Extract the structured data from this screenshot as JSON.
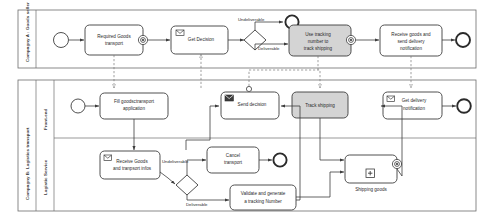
{
  "diagram": {
    "pools": [
      {
        "id": "poolA",
        "label": "Compagny A : Goods seller",
        "lanes": []
      },
      {
        "id": "poolB",
        "label": "Compagny B: Logistics transport",
        "lanes": [
          {
            "id": "laneFront",
            "label": "Front-end"
          },
          {
            "id": "laneService",
            "label": "Logistic Service"
          }
        ]
      }
    ],
    "nodes": {
      "a_start": {
        "type": "start-event",
        "label": ""
      },
      "a_required": {
        "type": "task",
        "label": "Required Goods transport",
        "marker": "message-send"
      },
      "a_decision": {
        "type": "task-message",
        "label": "Get Decision"
      },
      "a_gateway": {
        "type": "gateway-exclusive",
        "label": ""
      },
      "a_end_undel": {
        "type": "end-event",
        "label": ""
      },
      "a_track": {
        "type": "task-grey",
        "label": "Use tracking number to track shipping",
        "marker": "message-send"
      },
      "a_receive": {
        "type": "task",
        "label": "Receive goods and send delivery notification"
      },
      "a_end": {
        "type": "end-event",
        "label": ""
      },
      "b_start": {
        "type": "start-event",
        "label": ""
      },
      "b_fill": {
        "type": "task",
        "label": "Fill goodsctransport application"
      },
      "b_send": {
        "type": "task-message-dark",
        "label": "Send decision",
        "marker": "message-send"
      },
      "b_trackship": {
        "type": "task-grey",
        "label": "Track shipping"
      },
      "b_getnotif": {
        "type": "task-message",
        "label": "Get delivery notification"
      },
      "b_end_notif": {
        "type": "end-event",
        "label": ""
      },
      "b_recv": {
        "type": "task-message",
        "label": "Receive Goods and tranpsort infos"
      },
      "b_gateway": {
        "type": "gateway-exclusive",
        "label": ""
      },
      "b_cancel": {
        "type": "task",
        "label": "Cancel transport"
      },
      "b_end_cancel": {
        "type": "end-event",
        "label": ""
      },
      "b_validate": {
        "type": "task",
        "label": "Validate and generate a tracking Number"
      },
      "b_shipping": {
        "type": "subprocess",
        "label": "Shipping goods",
        "marker": "collapsed-plus"
      }
    },
    "flow_labels": {
      "a_undeliverable": "Undeliverable",
      "a_deliverable": "Deliverable",
      "b_undeliverable": "Undeliverable",
      "b_deliverable": "Deliverable"
    },
    "colors": {
      "stroke": "#3c3c3c",
      "pool_stroke": "#6d6d6d",
      "task_fill": "#ffffff",
      "task_grey_fill": "#d4d4d4",
      "message_flow": "#7a7a7a",
      "text": "#2b2b2b"
    }
  }
}
